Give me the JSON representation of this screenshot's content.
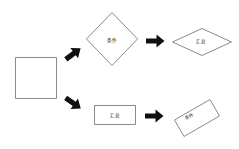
{
  "diagram": {
    "background_color": "#ffffff",
    "outline_color": "#8a8a8a",
    "arrow_color": "#101010",
    "label_color": "#1a1a1a",
    "width": 239,
    "height": 149
  },
  "nodes": [
    {
      "id": "source",
      "shape": "square",
      "label": "",
      "x": 15,
      "y": 57,
      "w": 42,
      "h": 42
    },
    {
      "id": "decision-top",
      "shape": "diamond",
      "label": "条件",
      "x": 86,
      "y": 12,
      "w": 52,
      "h": 54
    },
    {
      "id": "result-top",
      "shape": "diamond-wide",
      "label": "汇总",
      "x": 172,
      "y": 28,
      "w": 60,
      "h": 28
    },
    {
      "id": "process-bottom",
      "shape": "rectangle",
      "label": "汇总",
      "x": 94,
      "y": 105,
      "w": 42,
      "h": 20
    },
    {
      "id": "result-bottom",
      "shape": "rectangle-rotated",
      "label": "条件",
      "x": 176,
      "y": 102,
      "w": 42,
      "h": 30,
      "rotation": -30
    }
  ],
  "arrows": [
    {
      "id": "arrow-source-to-decision-top",
      "direction": "up-right",
      "from": "source",
      "to": "decision-top"
    },
    {
      "id": "arrow-source-to-process-bottom",
      "direction": "down-right",
      "from": "source",
      "to": "process-bottom"
    },
    {
      "id": "arrow-decision-top-to-result-top",
      "direction": "right",
      "from": "decision-top",
      "to": "result-top"
    },
    {
      "id": "arrow-process-bottom-to-result-bottom",
      "direction": "right",
      "from": "process-bottom",
      "to": "result-bottom"
    }
  ]
}
